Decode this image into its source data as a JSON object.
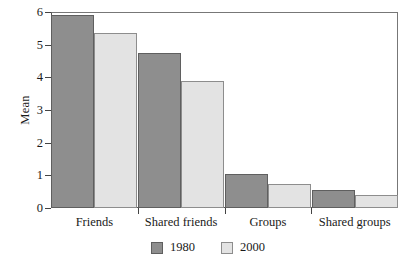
{
  "chart_data": {
    "type": "bar",
    "title": "",
    "xlabel": "",
    "ylabel": "Mean",
    "categories": [
      "Friends",
      "Shared friends",
      "Groups",
      "Shared groups"
    ],
    "series": [
      {
        "name": "1980",
        "color": "#8e8e8e",
        "values": [
          5.9,
          4.75,
          1.05,
          0.55
        ]
      },
      {
        "name": "2000",
        "color": "#e3e3e3",
        "values": [
          5.35,
          3.9,
          0.72,
          0.4
        ]
      }
    ],
    "ylim": [
      0,
      6
    ],
    "yticks": [
      0,
      1,
      2,
      3,
      4,
      5,
      6
    ],
    "ytick_labels": [
      "0",
      "1",
      "2",
      "3",
      "4",
      "5",
      "6"
    ],
    "grid": false,
    "legend_position": "bottom-center"
  }
}
